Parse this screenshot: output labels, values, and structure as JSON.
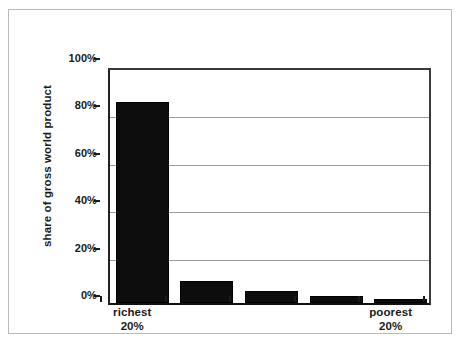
{
  "chart_data": {
    "type": "bar",
    "title": "",
    "xlabel": "",
    "ylabel": "share of gross world product",
    "ylim": [
      0,
      100
    ],
    "grid": true,
    "legend": "none",
    "bar_color": "#0d0d0d",
    "categories": [
      "richest 20%",
      "",
      "",
      "",
      "poorest 20%"
    ],
    "category_labels": [
      {
        "line1": "richest",
        "line2": "20%"
      },
      {
        "line1": "",
        "line2": ""
      },
      {
        "line1": "",
        "line2": ""
      },
      {
        "line1": "",
        "line2": ""
      },
      {
        "line1": "poorest",
        "line2": "20%"
      }
    ],
    "values": [
      85,
      9.5,
      5,
      3,
      1.5
    ],
    "ytick_labels": [
      "100%",
      "80%",
      "60%",
      "40%",
      "20%",
      "0%"
    ],
    "ytick_values": [
      100,
      80,
      60,
      40,
      20,
      0
    ]
  },
  "axis": {
    "y_title": "share of gross world product",
    "y_ticks": [
      {
        "label": "100%",
        "value": 100
      },
      {
        "label": "80%",
        "value": 80
      },
      {
        "label": "60%",
        "value": 60
      },
      {
        "label": "40%",
        "value": 40
      },
      {
        "label": "20%",
        "value": 20
      },
      {
        "label": "0%",
        "value": 0
      }
    ],
    "x_labels": [
      {
        "line1": "richest",
        "line2": "20%"
      },
      {
        "line1": "",
        "line2": ""
      },
      {
        "line1": "",
        "line2": ""
      },
      {
        "line1": "",
        "line2": ""
      },
      {
        "line1": "poorest",
        "line2": "20%"
      }
    ]
  },
  "colors": {
    "bar": "#0d0d0d",
    "gridline": "#9a9a9a",
    "axis": "#1a1a1a",
    "figure_border": "#b9b9b9",
    "background": "#ffffff"
  }
}
